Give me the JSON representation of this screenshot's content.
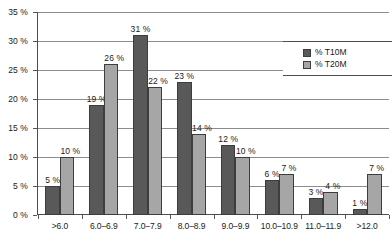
{
  "chart_data": {
    "type": "bar",
    "title": "",
    "subtitle": "",
    "xlabel": "",
    "ylabel": "",
    "ylim": [
      0,
      35
    ],
    "ytick_values": [
      0,
      5,
      10,
      15,
      20,
      25,
      30,
      35
    ],
    "ytick_labels": [
      "0 %",
      "5 %",
      "10 %",
      "15 %",
      "20 %",
      "25 %",
      "30 %",
      "35 %"
    ],
    "grid": true,
    "legend_position": "top-right",
    "categories": [
      ">6.0",
      "6.0–6.9",
      "7.0–7.9",
      "8.0–8.9",
      "9.0–9.9",
      "10.0–10.9",
      "11.0–11.9",
      ">12.0"
    ],
    "series": [
      {
        "name": "% T10M",
        "color": "#595959",
        "values": [
          5,
          19,
          31,
          23,
          12,
          6,
          3,
          1
        ],
        "labels": [
          "5 %",
          "19 %",
          "31 %",
          "23 %",
          "12 %",
          "6 %",
          "3 %",
          "1 %"
        ]
      },
      {
        "name": "% T20M",
        "color": "#a6a6a6",
        "values": [
          10,
          26,
          22,
          14,
          10,
          7,
          4,
          7
        ],
        "labels": [
          "10 %",
          "26 %",
          "22 %",
          "14 %",
          "10 %",
          "7 %",
          "4 %",
          "7 %"
        ]
      }
    ]
  }
}
